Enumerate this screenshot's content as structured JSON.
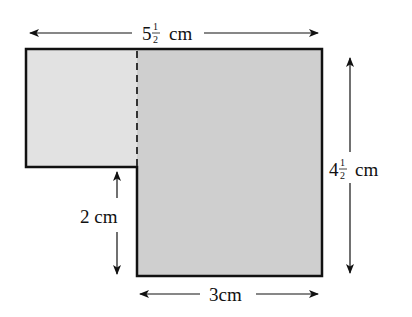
{
  "diagram": {
    "type": "composite L-shape (two rectangles)",
    "colors": {
      "left_region": "#e2e2e2",
      "right_region": "#cfcfcf",
      "outline": "#111111",
      "dashed_divider": "#333333"
    },
    "dimensions": {
      "top_width": {
        "whole": "5",
        "num": "1",
        "den": "2",
        "unit": "cm"
      },
      "right_height": {
        "whole": "4",
        "num": "1",
        "den": "2",
        "unit": "cm"
      },
      "step_height": {
        "text": "2 cm"
      },
      "bottom_width": {
        "text": "3cm"
      }
    }
  }
}
